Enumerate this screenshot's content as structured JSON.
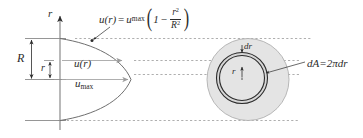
{
  "figure": {
    "axis": {
      "vertical_axis_label": "r"
    },
    "left_diagram": {
      "radius_label": "R",
      "local_radius_label": "r",
      "velocity_profile_label": "u(r)",
      "max_velocity_label_base": "u",
      "max_velocity_label_sub": "max",
      "equation": {
        "lhs": "u(r)",
        "equals": "=",
        "umax_base": "u",
        "umax_sub": "max",
        "open_paren": "(",
        "one": "1",
        "minus": "−",
        "frac_num_base": "r",
        "frac_num_sup": "2",
        "frac_den_base": "R",
        "frac_den_sup": "2",
        "close_paren": ")",
        "plain_text": "u(r) = umax(1 − r²/R²)"
      }
    },
    "right_diagram": {
      "ring_thickness_label": "dr",
      "ring_radius_label": "r",
      "area_equation": {
        "lhs": "dA",
        "equals": "=",
        "rhs": "2πdr",
        "plain_text": "dA = 2πdr"
      }
    },
    "colors": {
      "stroke_dark": "#2b2b2b",
      "stroke_gray": "#8a8a8a",
      "stroke_light_gray": "#b8b8b8",
      "dash_gray": "#9a9a9a",
      "circle_fill": "#e2e2e2",
      "ring_fill": "#d2d2d2",
      "background": "#ffffff"
    }
  }
}
